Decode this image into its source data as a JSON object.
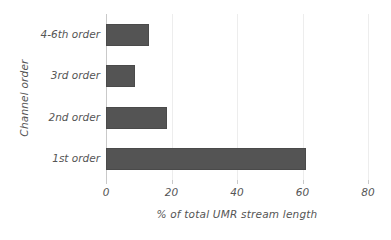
{
  "chart_data": {
    "type": "bar",
    "orientation": "horizontal",
    "title": "",
    "xlabel": "% of total UMR stream length",
    "ylabel": "Channel order",
    "categories": [
      "1st order",
      "2nd order",
      "3rd order",
      "4-6th order"
    ],
    "values": [
      61,
      18.5,
      9,
      13
    ],
    "xlim": [
      0,
      80
    ],
    "xticks": [
      0,
      20,
      40,
      60,
      80
    ],
    "xticklabels": [
      "0",
      "20",
      "40",
      "60",
      "80"
    ],
    "grid": "vertical",
    "legend": "none",
    "series": [
      {
        "name": "% of total UMR stream length",
        "values": [
          61,
          18.5,
          9,
          13
        ],
        "color": "#545454"
      }
    ],
    "bar_color": "#545454",
    "gridline_color": "#ededed",
    "axis_color": "#c9c9c9",
    "text_color": "#555555"
  }
}
